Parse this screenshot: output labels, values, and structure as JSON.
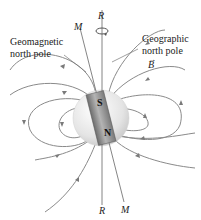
{
  "diagram": {
    "labels": {
      "rotation_axis_top": "R",
      "rotation_axis_bottom": "R",
      "magnetic_axis_top": "M",
      "magnetic_axis_bottom": "M",
      "geomagnetic_line1": "Geomagnetic",
      "geomagnetic_line2": "north pole",
      "geographic_line1": "Geographic",
      "geographic_line2": "north pole",
      "field_vector": "B",
      "magnet_south": "S",
      "magnet_north": "N"
    },
    "colors": {
      "field_lines": "#7a7a7a",
      "earth": "#e6e6e6",
      "magnet": "#8c8c8c"
    }
  }
}
